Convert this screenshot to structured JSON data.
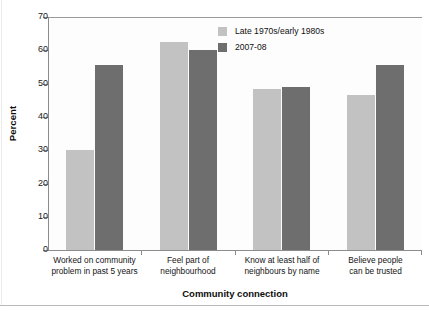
{
  "chart_data": {
    "type": "bar",
    "title": "",
    "xlabel": "Community connection",
    "ylabel": "Percent",
    "ylim": [
      0,
      70
    ],
    "yticks": [
      0,
      10,
      20,
      30,
      40,
      50,
      60,
      70
    ],
    "grid": false,
    "legend_position": "top-right",
    "categories": [
      "Worked on community problem in past 5 years",
      "Feel part of neighbourhood",
      "Know at least half of neighbours by name",
      "Believe people can be trusted"
    ],
    "category_lines": [
      [
        "Worked on community",
        "problem in past 5 years"
      ],
      [
        "Feel part of",
        "neighbourhood"
      ],
      [
        "Know at least half of",
        "neighbours by name"
      ],
      [
        "Believe people",
        "can be trusted"
      ]
    ],
    "series": [
      {
        "name": "Late 1970s/early 1980s",
        "color": "#c2c2c2",
        "values": [
          30,
          62.5,
          48.5,
          46.5
        ]
      },
      {
        "name": "2007-08",
        "color": "#6e6e6e",
        "values": [
          55.5,
          60,
          49,
          55.5
        ]
      }
    ]
  },
  "legend": {
    "items": [
      {
        "label": "Late 1970s/early 1980s",
        "color": "#c2c2c2"
      },
      {
        "label": "2007-08",
        "color": "#6e6e6e"
      }
    ]
  },
  "axes": {
    "y_title": "Percent",
    "x_title": "Community connection",
    "y_tick_labels": [
      "70",
      "60",
      "50",
      "40",
      "30",
      "20",
      "10",
      "0"
    ]
  }
}
